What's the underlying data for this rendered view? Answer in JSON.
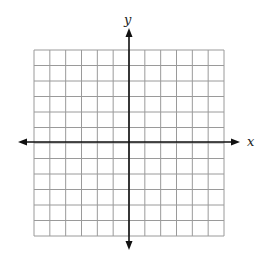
{
  "diagram": {
    "type": "coordinate-plane",
    "grid": {
      "columns": 12,
      "rows": 12,
      "left": 34,
      "top": 50,
      "right": 224,
      "bottom": 236,
      "line_color": "#9a9a9a"
    },
    "axes": {
      "color": "#111111",
      "origin_px": [
        129,
        142
      ],
      "x_label": "x",
      "y_label": "y",
      "x_extent_px": [
        18,
        240
      ],
      "y_extent_px": [
        28,
        250
      ]
    }
  }
}
